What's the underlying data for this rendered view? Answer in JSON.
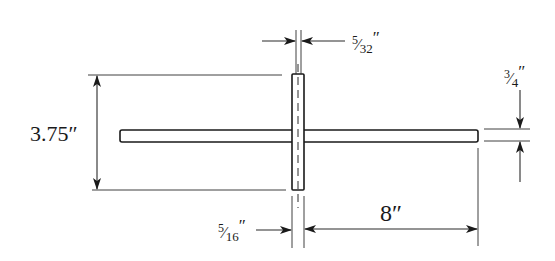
{
  "diagram": {
    "type": "engineering-dimension-drawing",
    "colors": {
      "ink": "#1a1a1a",
      "background": "#ffffff"
    },
    "parts": {
      "horizontal_bar": {
        "length_label": "8″ (right arm)",
        "thickness_label": "3/4″"
      },
      "vertical_bar": {
        "height_label": "3.75″",
        "width_label": "5/16″",
        "center_slot_label": "5/32″"
      }
    },
    "dimensions": {
      "overall_height": {
        "value": "3.75",
        "unit": "″"
      },
      "center_gap": {
        "numerator": "5",
        "denominator": "32",
        "unit": "″"
      },
      "bar_thickness": {
        "numerator": "3",
        "denominator": "4",
        "unit": "″"
      },
      "post_width": {
        "numerator": "5",
        "denominator": "16",
        "unit": "″"
      },
      "arm_length": {
        "value": "8",
        "unit": "″"
      }
    }
  }
}
